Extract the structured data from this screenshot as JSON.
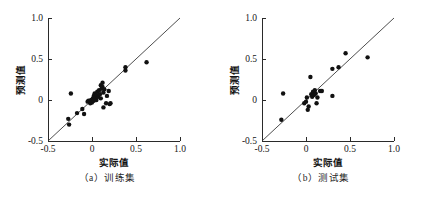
{
  "figure": {
    "width": 428,
    "height": 198,
    "background": "#ffffff",
    "point_color": "#111111",
    "axis_color": "#2a2a2a",
    "line_color": "#3a3a3a"
  },
  "panels": [
    {
      "id": "a",
      "caption": "（a）训练集",
      "xlabel": "实际值",
      "ylabel": "预测值"
    },
    {
      "id": "b",
      "caption": "（b）测试集",
      "xlabel": "实际值",
      "ylabel": "预测值"
    }
  ],
  "chart_data": [
    {
      "type": "scatter",
      "title": "（a）训练集",
      "xlabel": "实际值",
      "ylabel": "预测值",
      "xlim": [
        -0.5,
        1.0
      ],
      "ylim": [
        -0.5,
        1.0
      ],
      "xticks": [
        -0.5,
        0,
        0.5,
        1.0
      ],
      "xticklabels": [
        "-0.5",
        "0",
        "0.5",
        "1.0"
      ],
      "yticks": [
        -0.5,
        0,
        0.5,
        1.0
      ],
      "yticklabels": [
        "-0.5",
        "0",
        "0.5",
        "1.0"
      ],
      "grid": false,
      "legend": null,
      "reference_line": {
        "type": "identity",
        "from": [
          -0.5,
          -0.5
        ],
        "to": [
          1.0,
          1.0
        ]
      },
      "points": [
        [
          -0.27,
          -0.23
        ],
        [
          -0.26,
          -0.3
        ],
        [
          -0.24,
          0.08
        ],
        [
          -0.17,
          -0.16
        ],
        [
          -0.11,
          -0.11
        ],
        [
          -0.09,
          -0.17
        ],
        [
          -0.05,
          -0.02
        ],
        [
          -0.04,
          -0.01
        ],
        [
          -0.02,
          -0.04
        ],
        [
          -0.01,
          0.0
        ],
        [
          0.0,
          -0.03
        ],
        [
          0.01,
          0.02
        ],
        [
          0.02,
          -0.01
        ],
        [
          0.02,
          0.05
        ],
        [
          0.03,
          0.01
        ],
        [
          0.03,
          0.08
        ],
        [
          0.04,
          0.03
        ],
        [
          0.05,
          0.0
        ],
        [
          0.05,
          0.06
        ],
        [
          0.06,
          0.1
        ],
        [
          0.07,
          0.04
        ],
        [
          0.08,
          0.12
        ],
        [
          0.09,
          0.07
        ],
        [
          0.1,
          0.18
        ],
        [
          0.1,
          0.02
        ],
        [
          0.11,
          0.14
        ],
        [
          0.12,
          0.16
        ],
        [
          0.12,
          0.21
        ],
        [
          0.13,
          0.09
        ],
        [
          0.13,
          -0.09
        ],
        [
          0.14,
          0.13
        ],
        [
          0.16,
          -0.04
        ],
        [
          0.17,
          0.05
        ],
        [
          0.19,
          0.11
        ],
        [
          0.2,
          -0.05
        ],
        [
          0.21,
          -0.04
        ],
        [
          0.38,
          0.4
        ],
        [
          0.38,
          0.36
        ],
        [
          0.62,
          0.46
        ]
      ]
    },
    {
      "type": "scatter",
      "title": "（b）测试集",
      "xlabel": "实际值",
      "ylabel": "预测值",
      "xlim": [
        -0.5,
        1.0
      ],
      "ylim": [
        -0.5,
        1.0
      ],
      "xticks": [
        -0.5,
        0,
        0.5,
        1.0
      ],
      "xticklabels": [
        "-0.5",
        "0",
        "0.5",
        "1.0"
      ],
      "yticks": [
        -0.5,
        0,
        0.5,
        1.0
      ],
      "yticklabels": [
        "-0.5",
        "0",
        "0.5",
        "1.0"
      ],
      "grid": false,
      "legend": null,
      "reference_line": {
        "type": "identity",
        "from": [
          -0.5,
          -0.5
        ],
        "to": [
          1.0,
          1.0
        ]
      },
      "points": [
        [
          -0.28,
          -0.24
        ],
        [
          -0.26,
          0.08
        ],
        [
          -0.02,
          -0.04
        ],
        [
          0.0,
          -0.02
        ],
        [
          0.01,
          0.03
        ],
        [
          0.02,
          -0.12
        ],
        [
          0.03,
          -0.08
        ],
        [
          0.05,
          0.28
        ],
        [
          0.06,
          0.07
        ],
        [
          0.07,
          0.04
        ],
        [
          0.08,
          0.1
        ],
        [
          0.09,
          0.06
        ],
        [
          0.1,
          0.12
        ],
        [
          0.11,
          0.08
        ],
        [
          0.12,
          -0.04
        ],
        [
          0.13,
          0.03
        ],
        [
          0.16,
          0.11
        ],
        [
          0.18,
          0.11
        ],
        [
          0.3,
          0.38
        ],
        [
          0.3,
          0.05
        ],
        [
          0.37,
          0.4
        ],
        [
          0.45,
          0.57
        ],
        [
          0.7,
          0.52
        ]
      ]
    }
  ]
}
